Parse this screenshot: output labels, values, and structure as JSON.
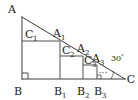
{
  "figure": {
    "background_color": "#ffffff",
    "line_color": "#3a3a3a",
    "label_color": "#1a1a1a",
    "vertices": {
      "A": "A",
      "B": "B",
      "C": "C"
    },
    "hypotenuse_points": {
      "A1_base": "A",
      "A1_sub": "1",
      "A2_base": "A",
      "A2_sub": "2",
      "A3_base": "A",
      "A3_sub": "3"
    },
    "base_points": {
      "B1_base": "B",
      "B1_sub": "1",
      "B2_base": "B",
      "B2_sub": "2",
      "B3_base": "B",
      "B3_sub": "3"
    },
    "square_corners": {
      "C1_base": "C",
      "C1_sub": "1",
      "C2_base": "C",
      "C2_sub": "2",
      "C3_base": "C",
      "C3_sub": "3"
    },
    "angle": {
      "value": "30",
      "degree_symbol": "°",
      "at_vertex": "C"
    },
    "ellipsis": "...",
    "right_angle_marks": 2
  }
}
